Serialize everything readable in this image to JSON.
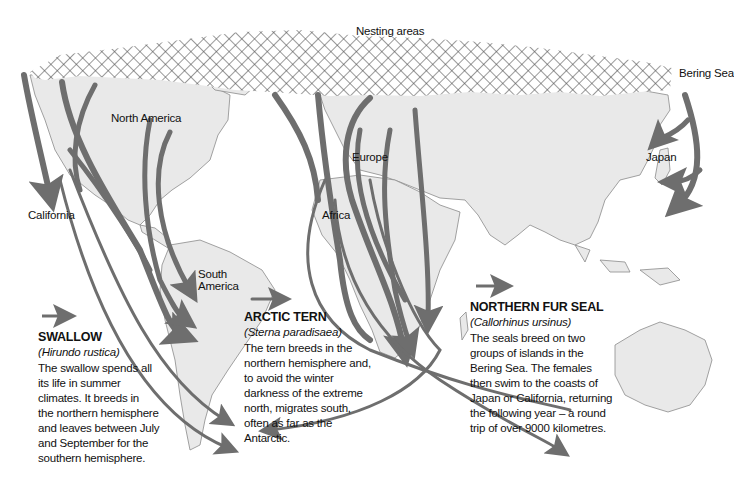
{
  "map": {
    "title": "Animal migration routes",
    "colors": {
      "land": "#e9e9e9",
      "coast": "#8a8a8a",
      "arrow": "#6e6e6e",
      "hatch": "#555555",
      "background": "#ffffff"
    },
    "labels": {
      "nesting_areas": "Nesting areas",
      "bering_sea": "Bering Sea",
      "north_america": "North America",
      "california": "California",
      "south_america_line1": "South",
      "south_america_line2": "America",
      "europe": "Europe",
      "africa": "Africa",
      "japan": "Japan"
    }
  },
  "legend": {
    "swallow": {
      "title": "SWALLOW",
      "scientific": "(Hirundo rustica)",
      "lines": [
        "The swallow spends all",
        "its life in summer",
        "climates. It breeds in",
        "the northern hemisphere",
        "and leaves between July",
        "and September for the",
        "southern hemisphere."
      ]
    },
    "arctic_tern": {
      "title": "ARCTIC TERN",
      "scientific": "(Sterna paradisaea)",
      "lines": [
        "The tern breeds in the",
        "northern hemisphere and,",
        "to avoid the winter",
        "darkness of the extreme",
        "north, migrates south,",
        "often as far as the",
        "Antarctic."
      ]
    },
    "northern_fur_seal": {
      "title": "NORTHERN FUR SEAL",
      "scientific": "(Callorhinus ursinus)",
      "lines": [
        "The seals breed on two",
        "groups of islands in the",
        "Bering Sea. The females",
        "then swim to the coasts of",
        "Japan or California, returning",
        "the following year – a round",
        "trip of over 9000 kilometres."
      ]
    }
  }
}
